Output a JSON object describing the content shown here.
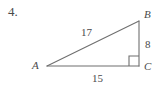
{
  "figure": {
    "problem_number": "4.",
    "vertices": [
      {
        "name": "A",
        "label": "A",
        "x": 47,
        "y": 66
      },
      {
        "name": "B",
        "label": "B",
        "x": 139,
        "y": 21
      },
      {
        "name": "C",
        "label": "C",
        "x": 139,
        "y": 66
      }
    ],
    "sides": [
      {
        "name": "hypotenuse-AB",
        "label": "17",
        "value": 17
      },
      {
        "name": "leg-BC",
        "label": "8",
        "value": 8
      },
      {
        "name": "base-AC",
        "label": "15",
        "value": 15
      }
    ],
    "right_angle": {
      "at_vertex": "C",
      "marker": "right-angle-square"
    },
    "colors": {
      "stroke": "#6f6f6f",
      "text": "#4a4a4a",
      "background": "#ffffff"
    }
  }
}
